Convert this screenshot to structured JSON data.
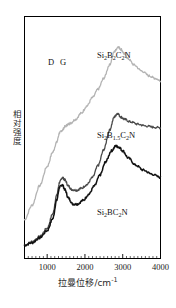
{
  "chart_data": {
    "type": "line",
    "title": "",
    "xlabel": "拉曼位移/cm",
    "xlabel_unit_sup": "-1",
    "ylabel": "相对强度",
    "xlim": [
      400,
      4000
    ],
    "ylim": [
      0,
      1
    ],
    "grid": false,
    "legend": "inline-annotations",
    "xticks": [
      1000,
      2000,
      3000,
      4000
    ],
    "xtick_labels": [
      "1000",
      "2000",
      "3000",
      "4000"
    ],
    "yticks": [],
    "ytick_labels": [],
    "minor_ticks": true,
    "annotations": [
      {
        "text": "D",
        "x": 1330,
        "y_label_px": 57,
        "x_label_px": 48
      },
      {
        "text": "G",
        "x": 1600,
        "y_label_px": 57,
        "x_label_px": 60
      }
    ],
    "series": [
      {
        "name": "Si2B2C2N",
        "label_html": "Si<sub>2</sub>B<sub>2</sub>C<sub>2</sub>N",
        "color": "#b3b3b3",
        "offset_note": "top trace",
        "label_px": {
          "x": 97,
          "y": 50
        },
        "x": [
          400,
          600,
          800,
          1000,
          1150,
          1250,
          1330,
          1400,
          1470,
          1560,
          1620,
          1750,
          1900,
          2050,
          2200,
          2350,
          2500,
          2650,
          2780,
          2880,
          2950,
          3050,
          3150,
          3300,
          3500,
          3700,
          3850,
          4000
        ],
        "values": [
          0.16,
          0.22,
          0.3,
          0.38,
          0.44,
          0.48,
          0.52,
          0.53,
          0.545,
          0.555,
          0.56,
          0.575,
          0.6,
          0.63,
          0.665,
          0.7,
          0.745,
          0.8,
          0.855,
          0.875,
          0.865,
          0.845,
          0.825,
          0.8,
          0.775,
          0.755,
          0.745,
          0.735
        ]
      },
      {
        "name": "Si2B1.5C2N",
        "label_html": "Si<sub>2</sub>B<sub>1.5</sub>C<sub>2</sub>N",
        "color": "#4a4a4a",
        "offset_note": "middle trace",
        "label_px": {
          "x": 97,
          "y": 130
        },
        "x": [
          400,
          600,
          800,
          1000,
          1150,
          1250,
          1330,
          1400,
          1470,
          1560,
          1650,
          1780,
          1900,
          2050,
          2200,
          2350,
          2500,
          2650,
          2780,
          2860,
          2950,
          3050,
          3200,
          3400,
          3600,
          3800,
          4000
        ],
        "values": [
          0.055,
          0.07,
          0.09,
          0.125,
          0.185,
          0.26,
          0.315,
          0.335,
          0.325,
          0.3,
          0.285,
          0.282,
          0.29,
          0.305,
          0.335,
          0.385,
          0.45,
          0.53,
          0.585,
          0.6,
          0.585,
          0.575,
          0.565,
          0.555,
          0.548,
          0.543,
          0.54
        ]
      },
      {
        "name": "Si2BC2N",
        "label_html": "Si<sub>2</sub>BC<sub>2</sub>N",
        "color": "#111111",
        "offset_note": "bottom trace",
        "label_px": {
          "x": 97,
          "y": 207
        },
        "x": [
          400,
          600,
          800,
          1000,
          1150,
          1250,
          1330,
          1400,
          1470,
          1560,
          1680,
          1800,
          1950,
          2100,
          2250,
          2400,
          2550,
          2700,
          2820,
          2900,
          3000,
          3150,
          3350,
          3550,
          3750,
          4000
        ],
        "values": [
          0.055,
          0.065,
          0.085,
          0.115,
          0.165,
          0.24,
          0.295,
          0.305,
          0.285,
          0.25,
          0.225,
          0.225,
          0.24,
          0.265,
          0.3,
          0.345,
          0.4,
          0.445,
          0.465,
          0.46,
          0.445,
          0.415,
          0.385,
          0.365,
          0.35,
          0.335
        ]
      }
    ]
  },
  "axes": {
    "frame_color": "#000000",
    "background": "#ffffff"
  }
}
